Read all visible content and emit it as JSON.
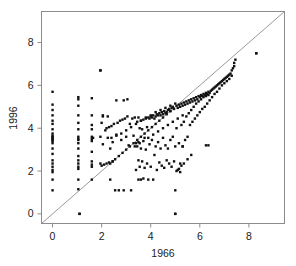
{
  "figure": {
    "background_color": "#ffffff",
    "frame_color": "#8c8c8c",
    "point_color": "#111111",
    "refline_color": "#9a9a9a"
  },
  "chart_data": {
    "type": "scatter",
    "title": "",
    "xlabel": "1966",
    "ylabel": "1996",
    "xlim": [
      -0.45,
      9.45
    ],
    "ylim": [
      -0.45,
      9.45
    ],
    "grid": false,
    "legend": null,
    "annotations": [
      {
        "kind": "reference-line",
        "label": "y = x",
        "from": [
          -0.45,
          -0.45
        ],
        "to": [
          9.45,
          9.45
        ]
      }
    ],
    "xticks": [
      0,
      2,
      4,
      6,
      8
    ],
    "yticks": [
      0,
      2,
      4,
      6,
      8
    ],
    "xtick_labels": [
      "0",
      "2",
      "4",
      "6",
      "8"
    ],
    "ytick_labels": [
      "0",
      "2",
      "4",
      "6",
      "8"
    ],
    "marker": "square",
    "marker_size_px": 2.4,
    "n_points": 312,
    "x": [
      0,
      0,
      0,
      0,
      0,
      0,
      0,
      0,
      0,
      0,
      0,
      0,
      0,
      0,
      0,
      0,
      0,
      0,
      0,
      0,
      0,
      0,
      0,
      0,
      1.05,
      1.05,
      1.05,
      1.05,
      1.05,
      1.05,
      1.05,
      1.05,
      1.05,
      1.05,
      1.05,
      1.05,
      1.05,
      1.05,
      1.05,
      1.05,
      1.05,
      1.05,
      1.1,
      1.6,
      1.6,
      1.6,
      1.6,
      1.6,
      1.6,
      1.6,
      1.6,
      1.6,
      1.6,
      1.6,
      1.6,
      1.65,
      1.95,
      1.95,
      1.95,
      2.0,
      2.0,
      2.05,
      2.05,
      2.1,
      2.15,
      2.2,
      2.2,
      2.25,
      2.3,
      2.3,
      2.35,
      2.35,
      2.4,
      2.45,
      2.45,
      2.5,
      2.55,
      2.6,
      2.65,
      2.7,
      2.75,
      2.8,
      2.85,
      2.9,
      2.95,
      3.0,
      3.05,
      3.05,
      3.1,
      3.15,
      3.2,
      3.25,
      3.3,
      3.35,
      3.4,
      3.4,
      3.45,
      3.45,
      3.5,
      3.5,
      3.5,
      3.5,
      3.55,
      3.55,
      3.6,
      3.6,
      3.6,
      3.65,
      3.65,
      3.7,
      3.7,
      3.75,
      3.75,
      3.8,
      3.8,
      3.85,
      3.85,
      3.9,
      3.9,
      3.95,
      3.95,
      4.0,
      4.0,
      4.05,
      4.05,
      4.1,
      4.1,
      4.15,
      4.15,
      4.2,
      4.2,
      4.25,
      4.25,
      4.3,
      4.3,
      4.35,
      4.35,
      4.4,
      4.4,
      4.45,
      4.45,
      4.5,
      4.5,
      4.55,
      4.55,
      4.6,
      4.6,
      4.65,
      4.65,
      4.7,
      4.7,
      4.75,
      4.75,
      4.8,
      4.8,
      4.85,
      4.85,
      4.9,
      4.9,
      4.95,
      4.95,
      5.0,
      5.0,
      5.0,
      5.05,
      5.05,
      5.1,
      5.1,
      5.15,
      5.15,
      5.2,
      5.2,
      5.25,
      5.25,
      5.3,
      5.3,
      5.35,
      5.35,
      5.4,
      5.4,
      5.45,
      5.45,
      5.5,
      5.5,
      5.55,
      5.55,
      5.6,
      5.6,
      5.65,
      5.65,
      5.7,
      5.7,
      5.75,
      5.75,
      5.8,
      5.8,
      5.85,
      5.85,
      5.9,
      5.9,
      5.95,
      5.95,
      6.0,
      6.0,
      6.05,
      6.05,
      6.1,
      6.1,
      6.15,
      6.15,
      6.2,
      6.2,
      6.25,
      6.25,
      6.3,
      6.3,
      6.35,
      6.35,
      6.4,
      6.4,
      6.45,
      6.5,
      6.5,
      6.55,
      6.6,
      6.6,
      6.65,
      6.7,
      6.7,
      6.75,
      6.8,
      6.8,
      6.85,
      6.9,
      6.9,
      6.95,
      7.0,
      7.0,
      7.05,
      7.1,
      7.1,
      7.15,
      7.2,
      7.2,
      7.25,
      7.3,
      7.3,
      7.35,
      7.4,
      7.4,
      7.45,
      8.3,
      2.35,
      2.45,
      2.55,
      2.7,
      2.85,
      3.0,
      3.15,
      3.3,
      3.45,
      3.6,
      3.75,
      3.9,
      4.05,
      4.2,
      4.35,
      4.5,
      4.65,
      4.8,
      2.4,
      2.6,
      2.8,
      3.0,
      3.2,
      3.4,
      3.6,
      3.8,
      4.0,
      4.2,
      4.4,
      4.6,
      4.8,
      5.0,
      3.35,
      3.55,
      3.7,
      3.9,
      4.1,
      4.3,
      4.5,
      4.7,
      4.9,
      5.1,
      5.3,
      5.05,
      5.15,
      5.25,
      5.35,
      5.5,
      5.65,
      5.2,
      5.3,
      6.25,
      6.35,
      1.95,
      8.3,
      1.1,
      5.0,
      2.05,
      2.25,
      2.6,
      2.9
    ],
    "y": [
      1.1,
      1.6,
      1.95,
      2.05,
      2.2,
      2.35,
      2.5,
      2.8,
      3.05,
      3.3,
      3.4,
      3.45,
      3.5,
      3.55,
      3.6,
      3.65,
      3.75,
      3.95,
      4.2,
      4.35,
      4.6,
      4.85,
      5.1,
      5.7,
      1.15,
      1.6,
      2.1,
      2.2,
      2.35,
      2.5,
      2.7,
      3.05,
      3.3,
      3.45,
      3.5,
      3.6,
      3.95,
      4.25,
      4.6,
      5.05,
      5.35,
      5.45,
      0.0,
      1.6,
      2.2,
      2.3,
      2.45,
      2.9,
      3.4,
      3.5,
      3.6,
      3.95,
      4.15,
      4.6,
      5.4,
      3.55,
      6.7,
      2.35,
      3.6,
      2.25,
      4.25,
      3.25,
      4.55,
      2.3,
      3.9,
      2.35,
      4.0,
      3.55,
      2.4,
      4.05,
      1.6,
      3.05,
      4.1,
      2.45,
      3.35,
      4.2,
      1.1,
      3.7,
      4.25,
      1.1,
      4.35,
      3.45,
      4.4,
      1.1,
      4.45,
      3.6,
      4.55,
      5.35,
      3.2,
      4.2,
      1.1,
      4.45,
      3.65,
      4.5,
      3.3,
      2.05,
      4.3,
      3.15,
      1.6,
      2.5,
      3.35,
      4.5,
      2.2,
      4.0,
      1.6,
      3.05,
      4.35,
      2.45,
      3.95,
      1.65,
      4.4,
      2.15,
      3.55,
      3.0,
      4.45,
      2.35,
      4.05,
      1.6,
      4.5,
      3.25,
      4.45,
      2.2,
      4.55,
      3.45,
      4.5,
      1.6,
      4.6,
      2.75,
      4.45,
      3.15,
      4.55,
      2.05,
      4.65,
      3.35,
      4.6,
      2.4,
      4.7,
      3.05,
      4.6,
      2.25,
      4.75,
      3.55,
      4.65,
      2.15,
      4.8,
      3.2,
      4.7,
      2.5,
      4.75,
      3.05,
      4.85,
      2.35,
      4.9,
      3.45,
      4.8,
      2.2,
      4.95,
      3.6,
      5.0,
      2.45,
      4.9,
      0.0,
      1.1,
      3.15,
      5.05,
      4.0,
      2.05,
      4.95,
      3.3,
      5.1,
      2.35,
      5.0,
      4.15,
      5.15,
      3.15,
      5.05,
      4.3,
      5.2,
      3.45,
      5.1,
      4.55,
      5.25,
      3.6,
      5.15,
      4.7,
      5.3,
      4.15,
      5.2,
      4.85,
      5.35,
      4.3,
      5.25,
      5.0,
      5.4,
      4.45,
      5.3,
      5.15,
      5.45,
      4.6,
      5.35,
      5.25,
      5.5,
      4.75,
      5.45,
      5.35,
      5.55,
      4.9,
      5.5,
      5.45,
      5.6,
      5.0,
      5.55,
      5.5,
      5.65,
      5.15,
      5.6,
      5.55,
      5.7,
      5.3,
      5.65,
      5.75,
      5.45,
      5.8,
      5.85,
      5.6,
      5.9,
      5.95,
      5.7,
      6.0,
      6.05,
      5.85,
      6.1,
      6.15,
      6.0,
      6.2,
      6.25,
      6.1,
      6.3,
      6.35,
      6.2,
      6.4,
      6.45,
      6.3,
      6.5,
      6.55,
      6.45,
      6.7,
      6.8,
      6.9,
      7.05,
      7.2,
      7.5,
      2.35,
      2.45,
      2.55,
      2.7,
      2.85,
      3.0,
      3.15,
      3.3,
      3.45,
      3.6,
      3.75,
      3.9,
      4.05,
      4.2,
      4.35,
      4.5,
      4.65,
      4.8,
      3.55,
      3.65,
      3.75,
      3.9,
      4.05,
      4.2,
      4.35,
      4.5,
      4.6,
      4.75,
      4.85,
      4.95,
      5.05,
      5.15,
      3.15,
      3.3,
      3.4,
      3.55,
      3.7,
      3.85,
      4.0,
      4.15,
      4.3,
      4.45,
      4.6,
      2.0,
      2.1,
      2.25,
      2.35,
      2.55,
      2.75,
      1.95,
      3.15,
      3.2,
      3.2,
      6.7,
      7.5,
      0.0,
      0.0,
      4.6,
      4.55,
      5.3,
      5.3
    ]
  }
}
